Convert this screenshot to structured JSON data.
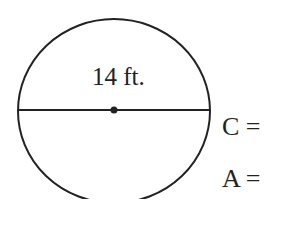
{
  "figure": {
    "shape": "circle",
    "diameter_label": "14 ft.",
    "questions": [
      {
        "label": "C ="
      },
      {
        "label": "A ="
      }
    ],
    "colors": {
      "stroke": "#222222",
      "background": "#ffffff"
    }
  }
}
